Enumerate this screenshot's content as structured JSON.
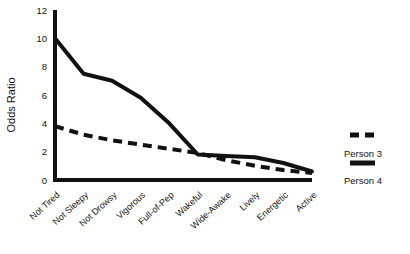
{
  "chart_data": {
    "type": "line",
    "title": "",
    "xlabel": "",
    "ylabel": "Odds Ratio",
    "categories": [
      "Not Tired",
      "Not Sleepy",
      "Not Drowsy",
      "Vigorous",
      "Full-of-Pep",
      "Wakeful",
      "Wide-Awake",
      "Lively",
      "Energetic",
      "Active"
    ],
    "ylim": [
      0,
      12
    ],
    "yticks": [
      0,
      2,
      4,
      6,
      8,
      10,
      12
    ],
    "ytick_labels": [
      "0",
      "2",
      "4",
      "6",
      "8",
      "10",
      "12"
    ],
    "grid": false,
    "legend_position": "right",
    "series": [
      {
        "name": "Person 3",
        "style": "dashed",
        "color": "#111111",
        "values": [
          3.8,
          3.2,
          2.8,
          2.5,
          2.2,
          1.9,
          1.4,
          1.0,
          0.7,
          0.5
        ]
      },
      {
        "name": "Person 4",
        "style": "solid",
        "color": "#111111",
        "values": [
          10.0,
          7.5,
          7.0,
          5.8,
          4.0,
          1.8,
          1.7,
          1.6,
          1.2,
          0.6
        ]
      }
    ]
  },
  "legend": {
    "entries": [
      {
        "label": "Person 3",
        "style": "dashed"
      },
      {
        "label": "Person 4",
        "style": "solid"
      }
    ]
  }
}
